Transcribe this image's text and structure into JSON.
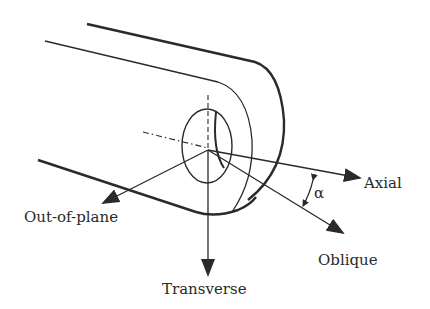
{
  "figure": {
    "colors": {
      "ink": "#2a2a2a",
      "background": "#ffffff"
    }
  },
  "labels": {
    "axial": "Axial",
    "oblique": "Oblique",
    "transverse": "Transverse",
    "out_of_plane": "Out-of-plane",
    "angle": "α"
  }
}
